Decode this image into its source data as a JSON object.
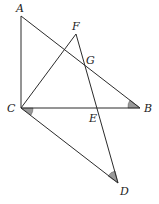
{
  "diagram": {
    "type": "geometry",
    "points": {
      "A": {
        "label": "A",
        "x": 21,
        "y": 16,
        "lx": 16,
        "ly": 12
      },
      "F": {
        "label": "F",
        "x": 76,
        "y": 34,
        "lx": 72,
        "ly": 30
      },
      "G": {
        "label": "G",
        "x": 85,
        "y": 63,
        "lx": 86,
        "ly": 64
      },
      "C": {
        "label": "C",
        "x": 21,
        "y": 108,
        "lx": 8,
        "ly": 112
      },
      "B": {
        "label": "B",
        "x": 140,
        "y": 108,
        "lx": 144,
        "ly": 112
      },
      "E": {
        "label": "E",
        "x": 97,
        "y": 108,
        "lx": 89,
        "ly": 122
      },
      "D": {
        "label": "D",
        "x": 118,
        "y": 183,
        "lx": 120,
        "ly": 194
      }
    },
    "segments": [
      [
        "A",
        "C"
      ],
      [
        "A",
        "B"
      ],
      [
        "C",
        "B"
      ],
      [
        "C",
        "F"
      ],
      [
        "F",
        "D"
      ],
      [
        "C",
        "D"
      ]
    ],
    "marked_angles": [
      "ACD-at-C",
      "ABC-at-B",
      "CDF-at-D"
    ],
    "colors": {
      "stroke": "#2b2b2b",
      "angle_fill": "#9a9a9a",
      "background": "#ffffff"
    }
  }
}
